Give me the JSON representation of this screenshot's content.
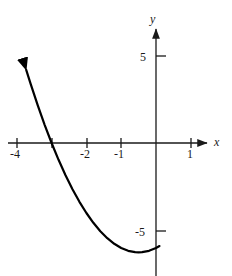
{
  "figure": {
    "background_color": "#ffffff",
    "stroke_color": "#1a1a1a",
    "curve_color": "#000000"
  },
  "axes": {
    "x_axis_label": "x",
    "y_axis_label": "y",
    "x_label_pos": {
      "left": 214,
      "top": 136
    },
    "y_label_pos": {
      "left": 150,
      "top": 13
    },
    "origin_px": {
      "x": 156,
      "y": 143
    },
    "px_per_unit_x": 34.8,
    "px_per_unit_y": 17.5,
    "x_axis_line": {
      "x1": 8,
      "y1": 143,
      "x2": 207,
      "y2": 143
    },
    "y_axis_line": {
      "x1": 156,
      "y1": 276,
      "x2": 156,
      "y2": 29
    },
    "x_ticks": [
      {
        "value": -4,
        "label": "-4",
        "px": 17,
        "label_left": 10,
        "label_top": 148
      },
      {
        "value": -3,
        "label": "",
        "px": 52,
        "label_left": 0,
        "label_top": 0
      },
      {
        "value": -2,
        "label": "-2",
        "px": 87,
        "label_left": 80,
        "label_top": 148
      },
      {
        "value": -1,
        "label": "-1",
        "px": 121,
        "label_left": 114,
        "label_top": 148
      },
      {
        "value": 1,
        "label": "1",
        "px": 191,
        "label_left": 187,
        "label_top": 148
      }
    ],
    "y_ticks": [
      {
        "value": 5,
        "label": "5",
        "px": 56,
        "label_left": 140,
        "label_top": 51
      },
      {
        "value": -5,
        "label": "-5",
        "px": 231,
        "label_left": 135,
        "label_top": 226
      }
    ],
    "tick_half_len_x": 5,
    "tick_len_y": 10
  },
  "chart_data": {
    "type": "line",
    "title": "",
    "xlabel": "x",
    "ylabel": "y",
    "xlim": [
      -4.25,
      1.45
    ],
    "ylim": [
      -7.6,
      6.7
    ],
    "grid": false,
    "legend": null,
    "curve_equation": "y = x^2 + x - 6",
    "roots": [
      -3,
      2
    ],
    "vertex": {
      "x": -0.5,
      "y": -6.25
    },
    "y_intercept": -6,
    "arrow_ends": [
      "start"
    ],
    "drawn_x_range": [
      -3.73,
      1.0
    ],
    "x": [
      -3.73,
      -3.6,
      -3.4,
      -3.2,
      -3.0,
      -2.8,
      -2.6,
      -2.4,
      -2.2,
      -2.0,
      -1.8,
      -1.6,
      -1.4,
      -1.2,
      -1.0,
      -0.8,
      -0.6,
      -0.5,
      -0.4,
      -0.2,
      0.0,
      0.1
    ],
    "y": [
      4.18,
      3.36,
      2.16,
      1.04,
      0.0,
      -0.96,
      -1.84,
      -2.64,
      -3.36,
      -4.0,
      -4.56,
      -5.04,
      -5.44,
      -5.76,
      -6.0,
      -6.16,
      -6.24,
      -6.25,
      -6.24,
      -6.16,
      -6.0,
      -5.89
    ],
    "series": [
      {
        "name": "y = x^2 + x - 6",
        "x": [
          -3.73,
          -3.6,
          -3.4,
          -3.2,
          -3.0,
          -2.8,
          -2.6,
          -2.4,
          -2.2,
          -2.0,
          -1.8,
          -1.6,
          -1.4,
          -1.2,
          -1.0,
          -0.8,
          -0.6,
          -0.5,
          -0.4,
          -0.2,
          0.0,
          0.1
        ],
        "y": [
          4.18,
          3.36,
          2.16,
          1.04,
          0.0,
          -0.96,
          -1.84,
          -2.64,
          -3.36,
          -4.0,
          -4.56,
          -5.04,
          -5.44,
          -5.76,
          -6.0,
          -6.16,
          -6.24,
          -6.25,
          -6.24,
          -6.16,
          -6.0,
          -5.89
        ]
      }
    ]
  }
}
